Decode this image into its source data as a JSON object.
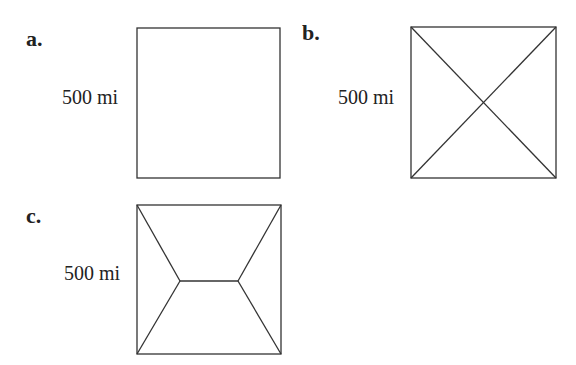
{
  "panels": [
    {
      "label": "a.",
      "dimension": "500 mi",
      "network": "square-only"
    },
    {
      "label": "b.",
      "dimension": "500 mi",
      "network": "square-with-diagonals"
    },
    {
      "label": "c.",
      "dimension": "500 mi",
      "network": "steiner-tree"
    }
  ],
  "colors": {
    "stroke": "#333333",
    "background": "#ffffff"
  }
}
